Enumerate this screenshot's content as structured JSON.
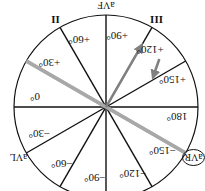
{
  "diagram": {
    "rotation_deg": 180,
    "center": [
      106,
      107
    ],
    "radius": 92,
    "colors": {
      "axis": "#111111",
      "highlight_axis": "#a8a8a8",
      "vector": "#808080",
      "background": "#ffffff"
    },
    "angle_labels": [
      {
        "text": "0°",
        "angle": 0
      },
      {
        "text": "+30°",
        "angle": 30
      },
      {
        "text": "+60°",
        "angle": 60
      },
      {
        "text": "+90°",
        "angle": 90
      },
      {
        "text": "+120°",
        "angle": 120
      },
      {
        "text": "+150°",
        "angle": 150
      },
      {
        "text": "180°",
        "angle": 180
      },
      {
        "text": "−150°",
        "angle": -150
      },
      {
        "text": "−120°",
        "angle": -120
      },
      {
        "text": "−90°",
        "angle": -90
      },
      {
        "text": "−60°",
        "angle": -60
      },
      {
        "text": "−30°",
        "angle": -30
      }
    ],
    "lead_labels": [
      {
        "text": "aVF",
        "angle": 90
      },
      {
        "text": "aVL",
        "angle": -30
      },
      {
        "text": "aVR",
        "angle": -150,
        "circled": true
      }
    ],
    "roman_labels": [
      {
        "text": "II",
        "angle": 60
      },
      {
        "text": "III",
        "angle": 120
      }
    ],
    "highlighted_axis": {
      "from_angle": 30,
      "to_angle": -150,
      "lead": "aVR"
    },
    "vectors": [
      {
        "name": "main-axis-vector",
        "angle": 120,
        "length_ratio": 0.78
      },
      {
        "name": "secondary-vector",
        "angle": 150,
        "length_ratio": 0.25,
        "offset_ratio": 0.6
      }
    ]
  }
}
